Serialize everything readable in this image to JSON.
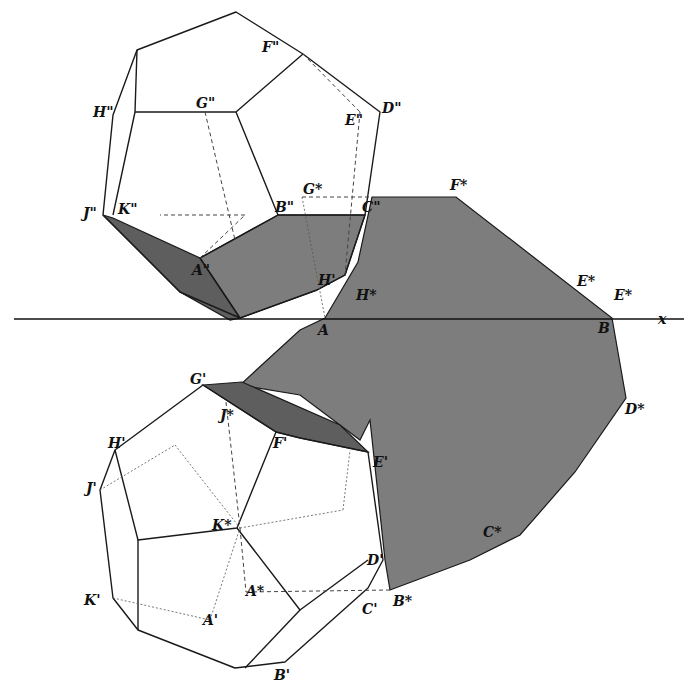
{
  "figure": {
    "type": "descriptive-geometry construction",
    "axis_label": "x",
    "colors": {
      "line": "#1a1a1a",
      "shadow": "#7d7d7d",
      "self_shadow": "#5e5e5e",
      "background": "#ffffff"
    }
  },
  "labels": {
    "upper": {
      "F2": "F\"",
      "H2": "H\"",
      "G2": "G\"",
      "E2": "E\"",
      "D2": "D\"",
      "J2": "J\"",
      "K2": "K\"",
      "B2": "B\"",
      "G_star_top": "G*",
      "C2": "C\"",
      "A2": "A\"",
      "H_prime_upper": "H'",
      "H_star": "H*",
      "F_star": "F*",
      "E_star": "E*",
      "E_sub": "E*",
      "A_axis": "A",
      "B_axis": "B"
    },
    "lower": {
      "G1": "G'",
      "J_star": "J*",
      "H1": "H'",
      "F1": "F'",
      "E1": "E'",
      "J1": "J'",
      "K_star": "K*",
      "D_star": "D*",
      "C_star": "C*",
      "D1": "D'",
      "A_star": "A*",
      "K1": "K'",
      "C1": "C'",
      "B_star": "B*",
      "A1": "A'",
      "B1": "B'"
    }
  }
}
